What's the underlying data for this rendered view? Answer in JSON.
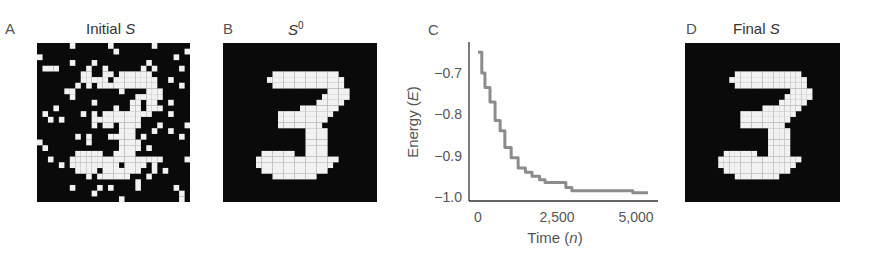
{
  "panels": {
    "a": {
      "letter": "A",
      "title_prefix": "Initial ",
      "title_var": "S"
    },
    "b": {
      "letter": "B",
      "title_var": "S",
      "title_sup": "0"
    },
    "c": {
      "letter": "C"
    },
    "d": {
      "letter": "D",
      "title_prefix": "Final ",
      "title_var": "S"
    }
  },
  "chart_data": {
    "type": "line",
    "title": "",
    "xlabel": "Time (n)",
    "ylabel": "Energy (E)",
    "xlim": [
      0,
      5500
    ],
    "ylim": [
      -1.0,
      -0.63
    ],
    "xticks": [
      0,
      2500,
      5000
    ],
    "xtick_labels": [
      "0",
      "2,500",
      "5,000"
    ],
    "yticks": [
      -0.7,
      -0.8,
      -0.9,
      -1.0
    ],
    "ytick_labels": [
      "−0.7",
      "−0.8",
      "−0.9",
      "−1.0"
    ],
    "grid": false,
    "series": [
      {
        "name": "Energy",
        "color": "#8c8c8c",
        "x": [
          0,
          120,
          220,
          380,
          540,
          700,
          850,
          1050,
          1270,
          1500,
          1710,
          1950,
          2120,
          2690,
          2780,
          2970,
          4810,
          4900,
          5380
        ],
        "y": [
          -0.65,
          -0.7,
          -0.735,
          -0.77,
          -0.815,
          -0.84,
          -0.88,
          -0.905,
          -0.93,
          -0.94,
          -0.95,
          -0.958,
          -0.965,
          -0.965,
          -0.977,
          -0.985,
          -0.985,
          -0.99,
          -0.99
        ]
      }
    ]
  },
  "colors": {
    "grid_black": "#0a0a0a",
    "grid_white": "#f2f2f2",
    "curve": "#8c8c8c",
    "axis": "#333333"
  }
}
